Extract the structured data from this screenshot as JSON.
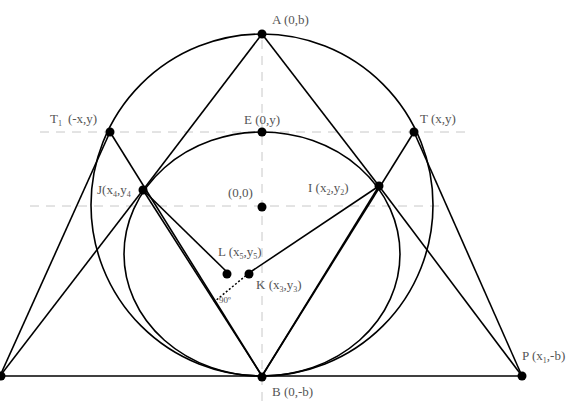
{
  "diagram": {
    "colors": {
      "stroke": "#000000",
      "guide": "#bbbbbb",
      "label": "#555555",
      "background": "#ffffff"
    },
    "points": {
      "A": {
        "name": "A",
        "coords": "(0,b)"
      },
      "E": {
        "name": "E",
        "coords": "(0,y)"
      },
      "T": {
        "name": "T",
        "coords": "(x,y)"
      },
      "T1": {
        "name": "T",
        "sub": "1",
        "coords": "(-x,y)"
      },
      "O": {
        "coords": "(0,0)"
      },
      "I": {
        "name": "I",
        "x": "x",
        "xs": "2",
        "y": "y",
        "ys": "2"
      },
      "J": {
        "name": "J",
        "x": "x",
        "xs": "4",
        "y": "y",
        "ys": "4"
      },
      "L": {
        "name": "L",
        "x": "x",
        "xs": "5",
        "y": "y",
        "ys": "5"
      },
      "K": {
        "name": "K",
        "x": "x",
        "xs": "3",
        "y": "y",
        "ys": "3"
      },
      "P": {
        "name": "P",
        "x": "x",
        "xs": "1",
        "rest": ",-b)"
      },
      "B": {
        "name": "B",
        "coords": "(0,-b)"
      }
    },
    "angle_label": "90º"
  }
}
